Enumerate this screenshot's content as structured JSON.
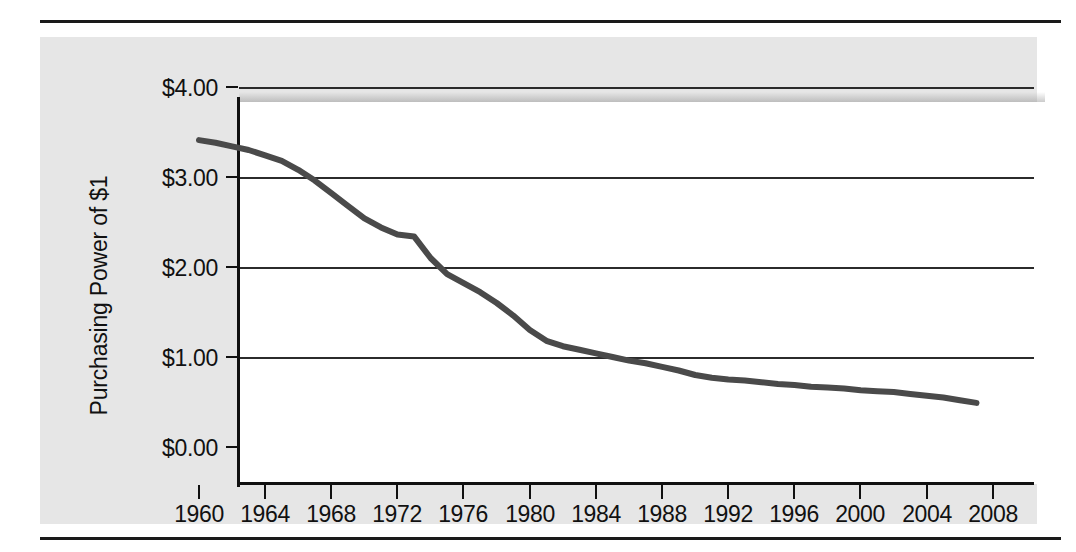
{
  "figure": {
    "panel_background": "#e6e6e6",
    "plot_background": "#ffffff",
    "line_color": "#4a4a4a",
    "axis_color": "#111111",
    "rule_color": "#1a1a1a"
  },
  "axes": {
    "y_title": "Purchasing Power of $1",
    "y_ticks": [
      "$0.00",
      "$1.00",
      "$2.00",
      "$3.00",
      "$4.00"
    ],
    "x_ticks": [
      "1960",
      "1964",
      "1968",
      "1972",
      "1976",
      "1980",
      "1984",
      "1988",
      "1992",
      "1996",
      "2000",
      "2004",
      "2008"
    ]
  },
  "chart_data": {
    "type": "line",
    "title": "",
    "xlabel": "",
    "ylabel": "Purchasing Power of $1",
    "xlim": [
      1960,
      2008
    ],
    "ylim": [
      0.0,
      4.0
    ],
    "grid": true,
    "legend": "none",
    "y_tick_values": [
      0.0,
      1.0,
      2.0,
      3.0,
      4.0
    ],
    "x_tick_values": [
      1960,
      1964,
      1968,
      1972,
      1976,
      1980,
      1984,
      1988,
      1992,
      1996,
      2000,
      2004,
      2008
    ],
    "series": [
      {
        "name": "Purchasing Power of $1",
        "x": [
          1960,
          1961,
          1962,
          1963,
          1964,
          1965,
          1966,
          1967,
          1968,
          1969,
          1970,
          1971,
          1972,
          1973,
          1974,
          1975,
          1976,
          1977,
          1978,
          1979,
          1980,
          1981,
          1982,
          1983,
          1984,
          1985,
          1986,
          1987,
          1988,
          1989,
          1990,
          1991,
          1992,
          1993,
          1994,
          1995,
          1996,
          1997,
          1998,
          1999,
          2000,
          2001,
          2002,
          2003,
          2004,
          2005,
          2006,
          2007
        ],
        "values": [
          3.41,
          3.38,
          3.34,
          3.3,
          3.24,
          3.18,
          3.08,
          2.96,
          2.82,
          2.68,
          2.54,
          2.44,
          2.36,
          2.34,
          2.1,
          1.92,
          1.82,
          1.72,
          1.6,
          1.46,
          1.3,
          1.18,
          1.12,
          1.08,
          1.04,
          1.0,
          0.96,
          0.93,
          0.89,
          0.85,
          0.8,
          0.77,
          0.75,
          0.74,
          0.72,
          0.7,
          0.69,
          0.67,
          0.66,
          0.65,
          0.63,
          0.62,
          0.61,
          0.59,
          0.57,
          0.55,
          0.52,
          0.49
        ]
      }
    ]
  }
}
